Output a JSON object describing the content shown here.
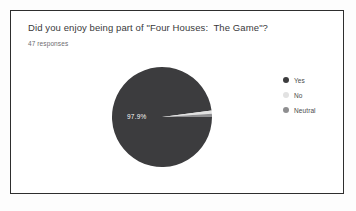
{
  "card": {
    "question": "Did you enjoy being part of \"Four Houses:  The Game\"?",
    "responses_text": "47 responses"
  },
  "colors": {
    "yes": "#3c3c3e",
    "no": "#e2e2e2",
    "neutral": "#8e8e90",
    "card_border": "#2e2e2e",
    "title_text": "#39393b",
    "subtitle_text": "#6d6d70",
    "legend_text": "#4a4a4c",
    "slice_label_text": "#ffffff"
  },
  "chart_data": {
    "type": "pie",
    "title": "Did you enjoy being part of \"Four Houses:  The Game\"?",
    "subtitle": "47 responses",
    "categories": [
      "Yes",
      "No",
      "Neutral"
    ],
    "values": [
      97.9,
      1.05,
      1.05
    ],
    "value_unit": "%",
    "counts": [
      46,
      0.5,
      0.5
    ],
    "total_responses": 47,
    "data_labels": [
      "97.9%",
      "",
      ""
    ],
    "colors": [
      "#3c3c3e",
      "#e2e2e2",
      "#8e8e90"
    ],
    "legend": {
      "position": "right",
      "entries": [
        {
          "label": "Yes",
          "color": "#3c3c3e"
        },
        {
          "label": "No",
          "color": "#e2e2e2"
        },
        {
          "label": "Neutral",
          "color": "#8e8e90"
        }
      ]
    },
    "start_angle_deg": 0,
    "direction": "clockwise",
    "grid": false
  },
  "pie_geometry": {
    "cx": 52,
    "cy": 52,
    "r": 50,
    "slices": [
      {
        "name": "Yes",
        "start_deg": 0,
        "end_deg": 352.4,
        "color": "#3c3c3e"
      },
      {
        "name": "No",
        "start_deg": 352.4,
        "end_deg": 356.2,
        "color": "#e2e2e2"
      },
      {
        "name": "Neutral",
        "start_deg": 356.2,
        "end_deg": 360,
        "color": "#8e8e90"
      }
    ]
  }
}
